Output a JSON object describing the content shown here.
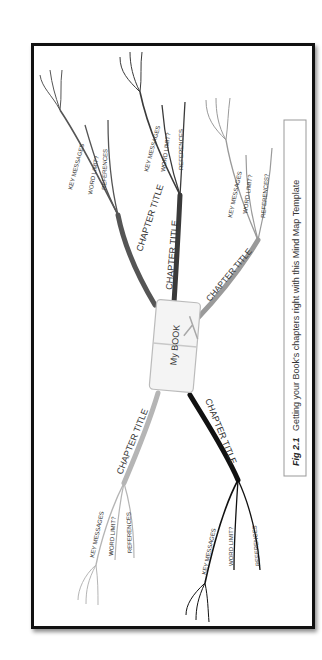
{
  "figure": {
    "caption_label": "Fig 2.1",
    "caption_text": "Getting your Book's chapters right with this Mind Map Template",
    "orientation": "rotated 90° counter-clockwise"
  },
  "mind_map": {
    "center": {
      "label": "My BOOK",
      "fill": "#f4f4f4",
      "border": "#bbbbbb"
    },
    "branches": [
      {
        "id": "top-left",
        "label": "CHAPTER TITLE",
        "color": "#555555",
        "sub_branches": [
          "KEY MESSAGES",
          "WORD LIMIT?",
          "REFERENCES"
        ]
      },
      {
        "id": "top-middle",
        "label": "CHAPTER TITLE",
        "color": "#3a3a3a",
        "sub_branches": [
          "KEY MESSAGES",
          "WORD LIMIT?",
          "REFERENCES"
        ]
      },
      {
        "id": "top-right",
        "label": "CHAPTER TITLE",
        "color": "#9a9a9a",
        "sub_branches": [
          "KEY MESSAGES",
          "WORD LIMIT?",
          "REFERENCES?"
        ]
      },
      {
        "id": "bottom-left",
        "label": "CHAPTER TITLE",
        "color": "#b5b5b5",
        "sub_branches": [
          "KEY MESSAGES",
          "WORD LIMIT?",
          "REFERENCES"
        ]
      },
      {
        "id": "bottom-right",
        "label": "CHAPTER TITLE",
        "color": "#111111",
        "sub_branches": [
          "KEY MESSAGES",
          "WORD LIMIT?",
          "REFERENCES"
        ]
      }
    ]
  }
}
